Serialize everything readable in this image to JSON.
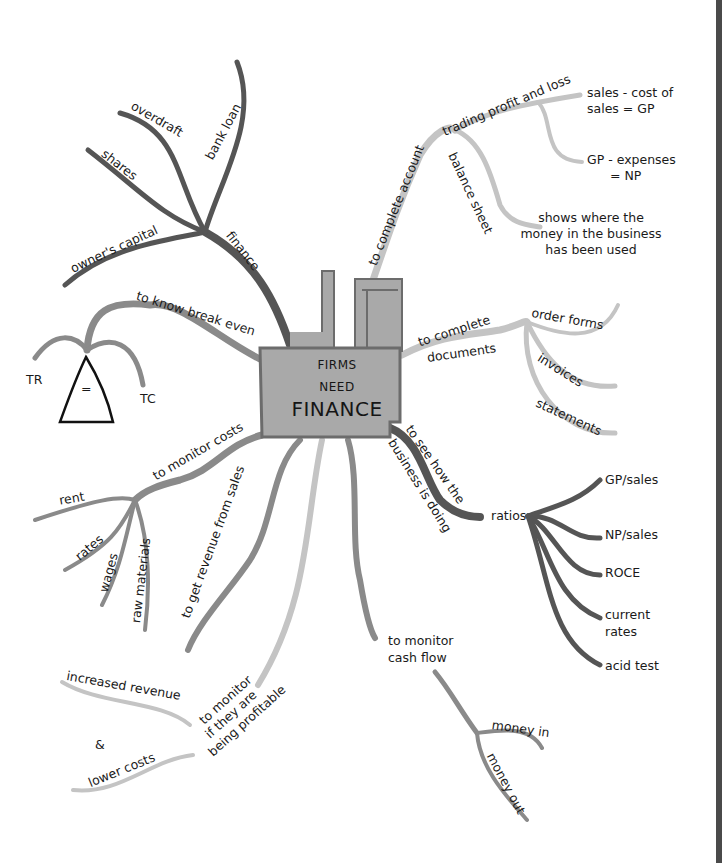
{
  "center": {
    "line1": "FIRMS",
    "line2": "NEED",
    "line3": "FINANCE"
  },
  "colors": {
    "dark_branch": "#555555",
    "mid_branch": "#8a8a8a",
    "light_branch": "#c4c4c4",
    "factory_fill": "#a9a9a9",
    "factory_edge": "#6c6c6c",
    "right_bar": "#4a4a4a"
  },
  "branches": {
    "finance": {
      "label": "finance",
      "children": [
        "owner's capital",
        "shares",
        "overdraft",
        "bank loan"
      ]
    },
    "break_even": {
      "label": "to know break even",
      "children": [
        "TR",
        "TC"
      ],
      "symbol": "="
    },
    "monitor_costs": {
      "label": "to monitor costs",
      "children": [
        "rent",
        "rates",
        "wages",
        "raw materials"
      ]
    },
    "revenue": {
      "label": "to get revenue from sales"
    },
    "profitable": {
      "label_lines": [
        "to monitor",
        "if they are",
        "being profitable"
      ],
      "children": [
        "increased revenue",
        "&",
        "lower costs"
      ]
    },
    "cash_flow": {
      "label_lines": [
        "to monitor",
        "cash flow"
      ],
      "children": [
        "money in",
        "money out"
      ]
    },
    "business_doing": {
      "label_lines": [
        "to see how the",
        "business is doing"
      ],
      "node": "ratios",
      "children": [
        "GP/sales",
        "NP/sales",
        "ROCE",
        "current rates",
        "acid test"
      ],
      "current_rates_lines": [
        "current",
        "rates"
      ]
    },
    "documents": {
      "label_lines": [
        "to complete",
        "documents"
      ],
      "children": [
        "order forms",
        "invoices",
        "statements"
      ]
    },
    "accounts": {
      "label": "to complete account",
      "children": {
        "trading": {
          "label": "trading profit and loss",
          "notes": [
            [
              "sales - cost of",
              "sales = GP"
            ],
            [
              "GP - expenses",
              "= NP"
            ]
          ]
        },
        "balance": {
          "label": "balance sheet",
          "note": [
            "shows where the",
            "money in the business",
            "has been used"
          ]
        }
      }
    }
  }
}
